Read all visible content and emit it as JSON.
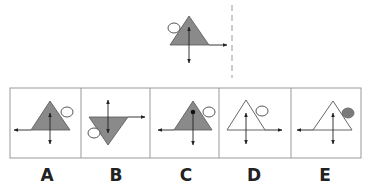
{
  "question": {
    "reference_figure": {
      "shape": "triangle-up",
      "fill": "gray",
      "circle": "outline-top-left",
      "horizontal_arrow": "right",
      "vertical_arrow": "double-headed"
    },
    "mirror_line": "dashed-vertical"
  },
  "options": [
    {
      "label": "A",
      "shape": "triangle-up",
      "fill": "gray",
      "circle": "outline-top-right",
      "horizontal_arrow": "left",
      "vertical_arrow": "double-headed"
    },
    {
      "label": "B",
      "shape": "triangle-down",
      "fill": "gray",
      "circle": "outline-bottom-left",
      "horizontal_arrow": "right",
      "vertical_arrow": "double-headed"
    },
    {
      "label": "C",
      "shape": "triangle-up",
      "fill": "gray",
      "circle": "outline-top-right",
      "horizontal_arrow": "left",
      "vertical_arrow": "down-from-dot"
    },
    {
      "label": "D",
      "shape": "triangle-up",
      "fill": "white",
      "circle": "outline-top-right",
      "horizontal_arrow": "right",
      "vertical_arrow": "double-headed"
    },
    {
      "label": "E",
      "shape": "triangle-up",
      "fill": "white",
      "circle": "filled-top-right",
      "horizontal_arrow": "left",
      "vertical_arrow": "double-headed"
    }
  ],
  "colors": {
    "triangle_fill": "#8a8a8a",
    "stroke": "#333333",
    "border": "#999999",
    "circle_fill": "#7a7a7a"
  }
}
